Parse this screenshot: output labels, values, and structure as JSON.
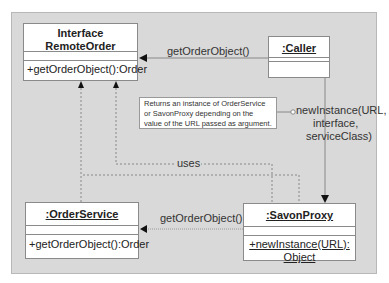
{
  "diagram": {
    "type": "UML class/collaboration diagram",
    "classes": {
      "remote_order": {
        "stereotype": "Interface",
        "name": "RemoteOrder",
        "operations": [
          "+getOrderObject():Order"
        ]
      },
      "caller": {
        "name": ":Caller",
        "operations": []
      },
      "order_service": {
        "name": ":OrderService",
        "operations": [
          "+getOrderObject():Order"
        ]
      },
      "savon_proxy": {
        "name": ":SavonProxy",
        "operations_line1": "+newInstance(URL):",
        "operations_line2": "Object"
      }
    },
    "messages": {
      "caller_to_remote": "getOrderObject()",
      "proxy_to_service": "getOrderObject()",
      "caller_to_proxy_1": "newInstance(URL,",
      "caller_to_proxy_2": "interface,",
      "caller_to_proxy_3": "serviceClass)",
      "uses": "uses"
    },
    "note": "Returns an instance of OrderService or SavonProxy depending on the value of the URL passed as argument."
  }
}
